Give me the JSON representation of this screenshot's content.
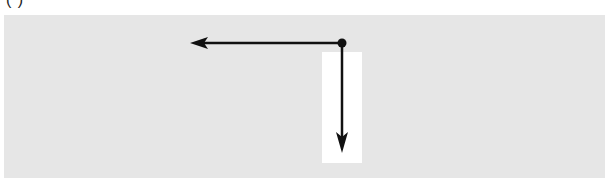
{
  "figure": {
    "caption_partial": "(                                )",
    "panel_color": "#e6e6e6",
    "highlight_color": "#ffffff",
    "arrow_color": "#111111",
    "origin": {
      "x": 342,
      "y": 43
    },
    "arrows": [
      {
        "name": "left-arrow",
        "direction": "left",
        "from": [
          342,
          43
        ],
        "to": [
          190,
          43
        ]
      },
      {
        "name": "down-arrow",
        "direction": "down",
        "from": [
          342,
          43
        ],
        "to": [
          342,
          153
        ]
      }
    ]
  }
}
